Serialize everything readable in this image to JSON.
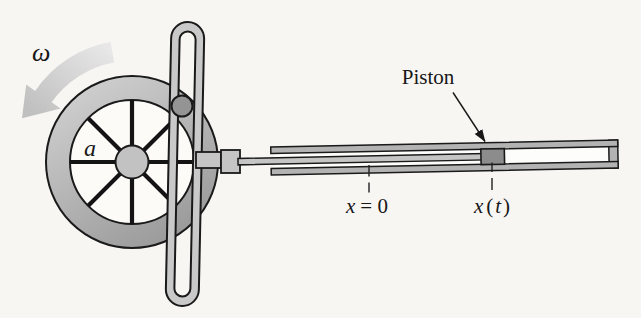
{
  "figure": {
    "labels": {
      "angular_velocity": "ω",
      "crank_radius": "a",
      "piston": "Piston",
      "x_zero": {
        "variable": "x",
        "rest": "= 0"
      },
      "x_t": {
        "variable": "x",
        "open": "(",
        "t": "t",
        "close": ")"
      }
    },
    "colors": {
      "background": "#f7f6f3",
      "outline": "#1a1a1a",
      "rim_light": "#d2d2d2",
      "rim_dark": "#989898",
      "wheel_face": "#fcfbf8",
      "hub": "#c2c2c2",
      "yoke": "#c9c9c9",
      "pin": "#949494",
      "rod": "#c5c5c5",
      "wall": "#b3b3b3",
      "cavity": "#fdfdfb",
      "piston": "#8c8c8c",
      "arrow_light": "#ebebeb",
      "arrow_dark": "#c0c0c0"
    }
  }
}
